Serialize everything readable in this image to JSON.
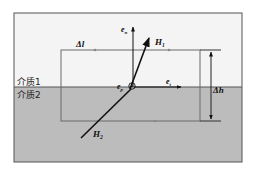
{
  "diagram": {
    "type": "boundary-condition-loop",
    "colors": {
      "medium1_fill": "#f4f4f4",
      "medium2_fill": "#bcbcbc",
      "frame_stroke": "#555555",
      "loop_stroke": "#6a6a6a",
      "vector_stroke": "#111111"
    },
    "labels": {
      "medium1": "介质1",
      "medium2": "介质2",
      "delta_l": "Δl",
      "delta_h": "Δh",
      "H1": "H",
      "H1_sub": "1",
      "H2": "H",
      "H2_sub": "2",
      "e_n": "e",
      "e_n_sub": "n",
      "e_t": "e",
      "e_t_sub": "t",
      "e_p": "e",
      "e_p_sub": "p"
    }
  }
}
